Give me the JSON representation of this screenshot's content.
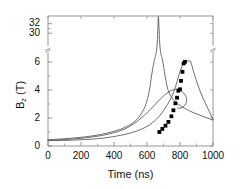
{
  "chart_data": {
    "type": "line",
    "title": "",
    "xlabel": "Time (ns)",
    "ylabel_main": "B",
    "ylabel_sub": "z",
    "ylabel_unit": " (T)",
    "ylabel_full": "Bz (T)",
    "xlim": [
      0,
      1000
    ],
    "xticks": [
      0,
      200,
      400,
      600,
      800,
      1000
    ],
    "xticklabels": [
      "0",
      "200",
      "400",
      "600",
      "800",
      "1000"
    ],
    "yticks": [
      0,
      2,
      4,
      6,
      30,
      32
    ],
    "yticklabels": [
      "0",
      "2",
      "4",
      "6",
      "30",
      "32"
    ],
    "y_axis_break": true,
    "y_break_between": [
      6,
      30
    ],
    "grid": false,
    "legend": false,
    "series": [
      {
        "name": "curve-1-narrow-spike",
        "type": "line",
        "color": "#555555",
        "points": [
          [
            0,
            0.45
          ],
          [
            100,
            0.52
          ],
          [
            200,
            0.62
          ],
          [
            300,
            0.78
          ],
          [
            400,
            1.05
          ],
          [
            470,
            1.35
          ],
          [
            530,
            1.8
          ],
          [
            580,
            2.6
          ],
          [
            610,
            3.7
          ],
          [
            630,
            5.2
          ],
          [
            645,
            8.0
          ],
          [
            655,
            14.0
          ],
          [
            662,
            24.0
          ],
          [
            666,
            31.0
          ],
          [
            668,
            33.2
          ],
          [
            670,
            33.2
          ],
          [
            673,
            31.0
          ],
          [
            677,
            24.0
          ],
          [
            684,
            14.0
          ],
          [
            694,
            8.0
          ],
          [
            710,
            5.0
          ],
          [
            730,
            3.9
          ],
          [
            760,
            3.3
          ],
          [
            800,
            2.9
          ],
          [
            860,
            2.5
          ],
          [
            920,
            2.2
          ],
          [
            1000,
            1.85
          ]
        ]
      },
      {
        "name": "curve-2-mid-peak",
        "type": "line",
        "color": "#555555",
        "points": [
          [
            0,
            0.4
          ],
          [
            100,
            0.46
          ],
          [
            200,
            0.55
          ],
          [
            300,
            0.7
          ],
          [
            400,
            0.95
          ],
          [
            480,
            1.3
          ],
          [
            550,
            1.85
          ],
          [
            620,
            2.6
          ],
          [
            680,
            3.35
          ],
          [
            730,
            3.85
          ],
          [
            770,
            4.05
          ],
          [
            800,
            4.0
          ],
          [
            820,
            3.8
          ],
          [
            835,
            3.55
          ],
          [
            840,
            3.3
          ],
          [
            835,
            3.0
          ],
          [
            820,
            2.8
          ],
          [
            800,
            2.7
          ],
          [
            785,
            2.72
          ]
        ]
      },
      {
        "name": "curve-3-broad-peak",
        "type": "line",
        "color": "#555555",
        "points": [
          [
            0,
            0.38
          ],
          [
            150,
            0.42
          ],
          [
            300,
            0.52
          ],
          [
            420,
            0.72
          ],
          [
            520,
            1.0
          ],
          [
            600,
            1.4
          ],
          [
            660,
            1.95
          ],
          [
            710,
            2.7
          ],
          [
            760,
            3.8
          ],
          [
            800,
            5.3
          ],
          [
            825,
            6.5
          ],
          [
            838,
            7.0
          ],
          [
            850,
            6.8
          ],
          [
            865,
            6.1
          ],
          [
            885,
            5.2
          ],
          [
            910,
            4.3
          ],
          [
            940,
            3.4
          ],
          [
            970,
            2.65
          ],
          [
            1000,
            1.9
          ]
        ]
      },
      {
        "name": "measured-data-squares",
        "type": "scatter",
        "marker": "square",
        "color": "#000000",
        "points": [
          [
            675,
            1.0
          ],
          [
            693,
            1.22
          ],
          [
            712,
            1.45
          ],
          [
            730,
            1.72
          ],
          [
            748,
            2.12
          ],
          [
            760,
            2.55
          ],
          [
            772,
            3.05
          ],
          [
            782,
            3.45
          ],
          [
            790,
            3.95
          ],
          [
            800,
            4.05
          ],
          [
            806,
            4.65
          ],
          [
            815,
            5.3
          ],
          [
            822,
            5.9
          ],
          [
            830,
            6.2
          ]
        ]
      }
    ]
  },
  "axis": {
    "frame_color": "#8a8a8a",
    "tick_color": "#8a8a8a",
    "break_marker": "//"
  }
}
